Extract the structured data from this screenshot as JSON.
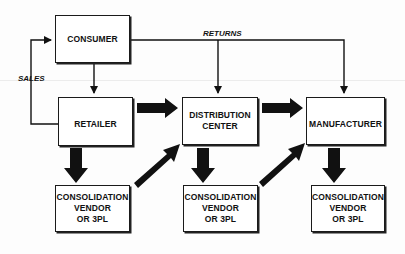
{
  "diagram": {
    "nodes": {
      "consumer": {
        "label": "CONSUMER"
      },
      "retailer": {
        "label": "RETAILER"
      },
      "distribution_center": {
        "line1": "DISTRIBUTION",
        "line2": "CENTER"
      },
      "manufacturer": {
        "label": "MANUFACTURER"
      },
      "consolidation_1": {
        "line1": "CONSOLIDATION",
        "line2": "VENDOR",
        "line3": "OR 3PL"
      },
      "consolidation_2": {
        "line1": "CONSOLIDATION",
        "line2": "VENDOR",
        "line3": "OR 3PL"
      },
      "consolidation_3": {
        "line1": "CONSOLIDATION",
        "line2": "VENDOR",
        "line3": "OR 3PL"
      }
    },
    "edge_labels": {
      "sales": "SALES",
      "returns": "RETURNS"
    },
    "edges": [
      {
        "from": "consumer",
        "to": "retailer",
        "type": "thin"
      },
      {
        "from": "retailer",
        "to": "consumer",
        "type": "thin",
        "label": "SALES"
      },
      {
        "from": "consumer",
        "to": "distribution_center",
        "type": "thin",
        "label": "RETURNS"
      },
      {
        "from": "consumer",
        "to": "manufacturer",
        "type": "thin",
        "label": "RETURNS"
      },
      {
        "from": "retailer",
        "to": "distribution_center",
        "type": "thick"
      },
      {
        "from": "distribution_center",
        "to": "manufacturer",
        "type": "thick"
      },
      {
        "from": "retailer",
        "to": "consolidation_1",
        "type": "thick"
      },
      {
        "from": "distribution_center",
        "to": "consolidation_2",
        "type": "thick"
      },
      {
        "from": "manufacturer",
        "to": "consolidation_3",
        "type": "thick"
      },
      {
        "from": "consolidation_1",
        "to": "distribution_center",
        "type": "thick"
      },
      {
        "from": "consolidation_2",
        "to": "manufacturer",
        "type": "thick"
      }
    ],
    "colors": {
      "line": "#111111",
      "background": "#ffffff"
    }
  }
}
